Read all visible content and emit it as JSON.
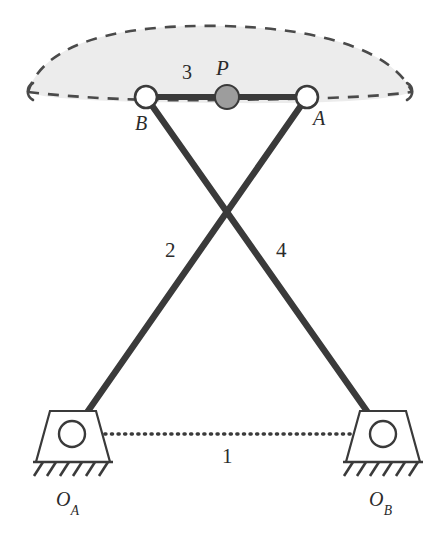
{
  "figure": {
    "type": "mechanism-diagram",
    "background_color": "#ffffff",
    "line_color": "#3a3a3a",
    "coupler_fill_color": "#ececec",
    "coupler_stroke_color": "#4a4a4a",
    "joint_fill_color": "#ffffff",
    "point_p_fill_color": "#9d9d9d"
  },
  "labels": {
    "point_p": "P",
    "point_a": "A",
    "point_b": "B",
    "link_1": "1",
    "link_2": "2",
    "link_3": "3",
    "link_4": "4",
    "pivot_oa_letter": "O",
    "pivot_oa_sub": "A",
    "pivot_ob_letter": "O",
    "pivot_ob_sub": "B"
  },
  "geometry": {
    "joint_a": {
      "x": 307,
      "y": 97,
      "r": 11
    },
    "joint_b": {
      "x": 146,
      "y": 97,
      "r": 11
    },
    "point_p": {
      "x": 227,
      "y": 97,
      "r": 12
    },
    "pivot_oa": {
      "x": 72,
      "y": 434,
      "r": 13
    },
    "pivot_ob": {
      "x": 383,
      "y": 434,
      "r": 13
    },
    "crossing": {
      "x": 229,
      "y": 212
    },
    "coupler_curve": {
      "left_tip": {
        "x": 28,
        "y": 92
      },
      "right_tip": {
        "x": 412,
        "y": 92
      },
      "apex_y": 26
    },
    "ground_line_y": 434
  },
  "links": [
    {
      "name": "link-1-ground",
      "label": "1",
      "style": "dotted",
      "from": "O_A",
      "to": "O_B"
    },
    {
      "name": "link-2-crank",
      "label": "2",
      "style": "solid",
      "from": "O_A",
      "to": "A"
    },
    {
      "name": "link-3-coupler",
      "label": "3",
      "style": "solid",
      "from": "B",
      "to": "A"
    },
    {
      "name": "link-4-crank",
      "label": "4",
      "style": "solid",
      "from": "O_B",
      "to": "B"
    }
  ]
}
